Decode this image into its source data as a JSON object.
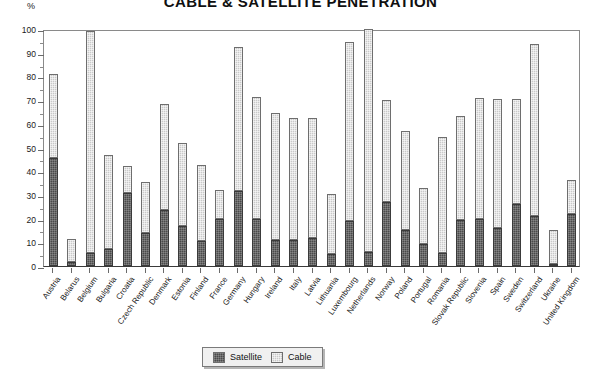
{
  "chart_data": {
    "type": "bar",
    "title": "CABLE & SATELLITE PENETRATION",
    "subtitle": "",
    "xlabel": "",
    "ylabel": "%",
    "ylim": [
      0,
      100
    ],
    "ytick_step": 10,
    "yticks": [
      0,
      10,
      20,
      30,
      40,
      50,
      60,
      70,
      80,
      90,
      100
    ],
    "grid": false,
    "stacked": true,
    "legend_position": "bottom-center",
    "categories": [
      "Austria",
      "Belarus",
      "Belgium",
      "Bulgaria",
      "Croatia",
      "Czech Republic",
      "Denmark",
      "Estonia",
      "Finland",
      "France",
      "Germany",
      "Hungary",
      "Ireland",
      "Italy",
      "Latvia",
      "Lithuania",
      "Luxembourg",
      "Netherlands",
      "Norway",
      "Poland",
      "Portugal",
      "Romania",
      "Slovak Republic",
      "Slovenia",
      "Spain",
      "Sweden",
      "Switzerland",
      "Ukraine",
      "United Kingdom"
    ],
    "series": [
      {
        "name": "Satellite",
        "color": "#4a4a4a",
        "values": [
          45.5,
          1.5,
          5.5,
          7,
          31,
          14,
          23.5,
          17,
          10.5,
          20,
          31.5,
          20,
          11,
          11,
          12,
          5,
          19,
          6,
          27,
          15,
          9.5,
          5.5,
          19.5,
          20,
          16,
          26,
          21,
          1,
          22
        ]
      },
      {
        "name": "Cable",
        "color": "#c9c9c9",
        "values": [
          35.5,
          10,
          93.5,
          40,
          11,
          21.5,
          45,
          35,
          32,
          12,
          61,
          51.5,
          53.5,
          51.5,
          50.5,
          25.5,
          75.5,
          94,
          43,
          42,
          23.5,
          49,
          44,
          51,
          54.5,
          44.5,
          72.5,
          14,
          14.5
        ]
      }
    ],
    "totals": [
      81,
      11.5,
      99,
      47,
      42,
      35.5,
      68.5,
      52,
      42.5,
      32,
      92.5,
      71.5,
      64.5,
      62.5,
      62.5,
      30.5,
      94.5,
      100,
      70,
      57,
      33,
      54.5,
      63.5,
      71,
      70.5,
      70.5,
      93.5,
      15,
      36.5
    ]
  },
  "legend": {
    "items": [
      {
        "label": "Satellite",
        "swatch": "satellite-swatch"
      },
      {
        "label": "Cable",
        "swatch": "cable-swatch"
      }
    ]
  }
}
